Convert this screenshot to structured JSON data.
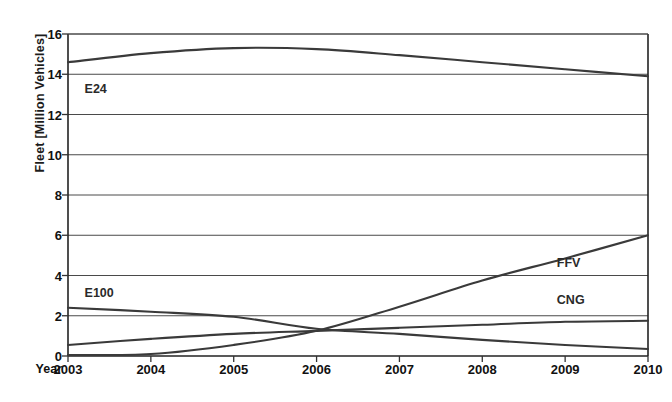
{
  "chart_data": {
    "type": "line",
    "title": "",
    "xlabel": "Year",
    "ylabel": "Fleet  [Million Vehicles]",
    "x": [
      "2003",
      "2004",
      "2005",
      "2006",
      "2007",
      "2008",
      "2009",
      "2010"
    ],
    "xlim": [
      2003,
      2010
    ],
    "ylim": [
      0,
      16
    ],
    "yticks": [
      0,
      2,
      4,
      6,
      8,
      10,
      12,
      14,
      16
    ],
    "ytick_labels": [
      "0",
      "2",
      "4",
      "6",
      "8",
      "10",
      "12",
      "14",
      "16"
    ],
    "grid": true,
    "legend_position": "inline-annotations",
    "series": [
      {
        "name": "E24",
        "label": "E24",
        "values": [
          14.6,
          15.05,
          15.3,
          15.25,
          14.95,
          14.6,
          14.25,
          13.9
        ]
      },
      {
        "name": "E100",
        "label": "E100",
        "values": [
          2.4,
          2.2,
          1.95,
          1.35,
          1.1,
          0.8,
          0.55,
          0.35
        ]
      },
      {
        "name": "CNG",
        "label": "CNG",
        "values": [
          0.55,
          0.85,
          1.1,
          1.25,
          1.4,
          1.55,
          1.7,
          1.75
        ]
      },
      {
        "name": "FFV",
        "label": "FFV",
        "values": [
          0.05,
          0.1,
          0.55,
          1.25,
          2.45,
          3.75,
          4.85,
          6.0
        ]
      }
    ],
    "annotations": [
      {
        "text": "E24",
        "x": 2003.2,
        "y": 13.2
      },
      {
        "text": "E100",
        "x": 2003.2,
        "y": 3.1
      },
      {
        "text": "FFV",
        "x": 2008.9,
        "y": 4.55
      },
      {
        "text": "CNG",
        "x": 2008.9,
        "y": 2.75
      }
    ]
  },
  "colors": {
    "background": "#ffffff",
    "line": "#3a3a3a",
    "grid": "#4a4a4a",
    "axis": "#222222",
    "text": "#111111"
  }
}
